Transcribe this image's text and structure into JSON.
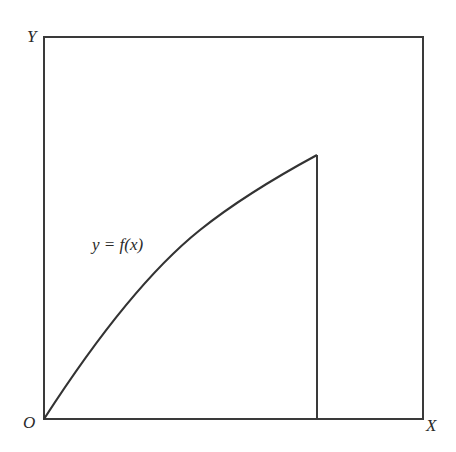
{
  "diagram": {
    "axis_y_label": "Y",
    "axis_x_label": "X",
    "origin_label": "O",
    "curve_label": "y = f(x)",
    "stroke_color": "#333333",
    "background_color": "#ffffff"
  }
}
